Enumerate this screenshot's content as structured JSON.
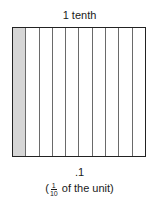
{
  "title": "1 tenth",
  "grid": {
    "total_columns": 10,
    "shaded_columns": 1,
    "shaded_color": "#d6d6d6",
    "line_color": "#6a6a6a",
    "border_color": "#222222"
  },
  "decimal_label": ".1",
  "fraction_label": {
    "open_paren": "(",
    "numerator": "1",
    "denominator": "10",
    "suffix": " of the unit)"
  }
}
